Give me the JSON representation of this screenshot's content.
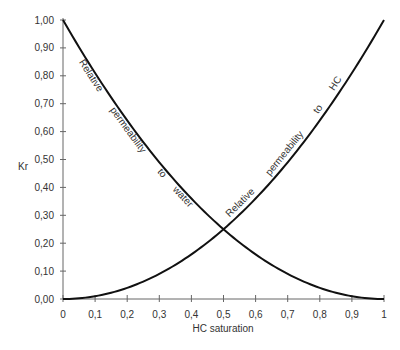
{
  "chart_data": {
    "type": "line",
    "title": "",
    "xlabel": "HC saturation",
    "ylabel": "Kr",
    "xlim": [
      0,
      1
    ],
    "ylim": [
      0,
      1
    ],
    "grid": false,
    "x_ticks": [
      "0",
      "0,1",
      "0,2",
      "0,3",
      "0,4",
      "0,5",
      "0,6",
      "0,7",
      "0,8",
      "0,9",
      "1"
    ],
    "y_ticks": [
      "0,00",
      "0,10",
      "0,20",
      "0,30",
      "0,40",
      "0,50",
      "0,60",
      "0,70",
      "0,80",
      "0,90",
      "1,00"
    ],
    "x": [
      0,
      0.1,
      0.2,
      0.3,
      0.4,
      0.5,
      0.6,
      0.7,
      0.8,
      0.9,
      1.0
    ],
    "series": [
      {
        "name": "Relative permeability to water",
        "values": [
          1.0,
          0.81,
          0.64,
          0.49,
          0.36,
          0.25,
          0.16,
          0.09,
          0.04,
          0.01,
          0.0
        ],
        "label_words": [
          "Relative",
          "permeability",
          "to",
          "water"
        ]
      },
      {
        "name": "Relative permeability to HC",
        "values": [
          0.0,
          0.01,
          0.04,
          0.09,
          0.16,
          0.25,
          0.36,
          0.49,
          0.64,
          0.81,
          1.0
        ],
        "label_words": [
          "Relative",
          "permeability",
          "to",
          "HC"
        ]
      }
    ],
    "annotations": [
      "Curves intersect at HC saturation 0,5, Kr 0,25"
    ]
  }
}
